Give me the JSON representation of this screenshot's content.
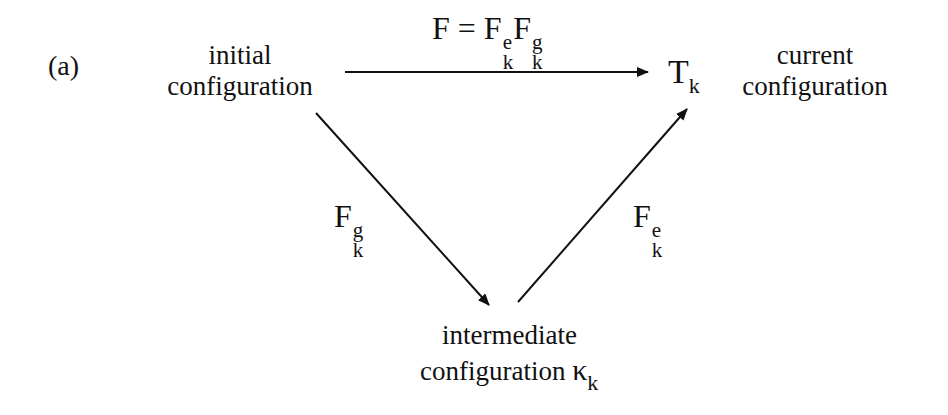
{
  "panel_label": "(a)",
  "nodes": {
    "initial": {
      "line1": "initial",
      "line2": "configuration"
    },
    "current": {
      "symbol": "T",
      "subscript": "k",
      "line1": "current",
      "line2": "configuration"
    },
    "intermediate": {
      "line1": "intermediate",
      "line2": "configuration",
      "symbol": "κ",
      "subscript": "k"
    }
  },
  "edges": {
    "top": {
      "lhs": "F",
      "eq": "=",
      "f1": "F",
      "f1_sup": "e",
      "f1_sub": "k",
      "f2": "F",
      "f2_sup": "g",
      "f2_sub": "k"
    },
    "left": {
      "symbol": "F",
      "sup": "g",
      "sub": "k"
    },
    "right": {
      "symbol": "F",
      "sup": "e",
      "sub": "k"
    }
  },
  "colors": {
    "ink": "#111111",
    "background": "#ffffff"
  }
}
